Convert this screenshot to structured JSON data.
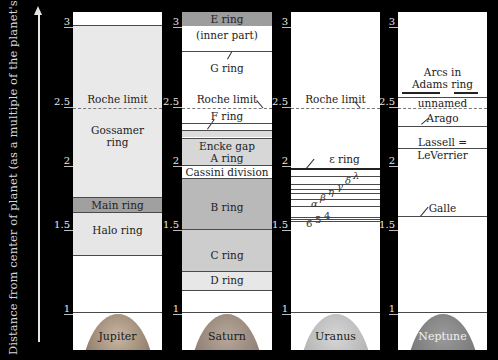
{
  "axis": {
    "label": "Distance from center of planet (as a multiple of the planet's radius)",
    "ticks": [
      "3",
      "2.5",
      "2",
      "1.5",
      "1"
    ]
  },
  "colors": {
    "background": "#000000",
    "column": "#ffffff",
    "light_band": "#e7e7e7",
    "medium_band": "#cfcfcf",
    "dark_band": "#9d9d9d",
    "roche_dash": "#777777"
  },
  "planets": [
    {
      "name": "Jupiter",
      "roche_label": "Roche limit",
      "rings": [
        {
          "label": "Gossamer ring",
          "line1": "Gossamer",
          "line2": "ring"
        },
        {
          "label": "Main ring"
        },
        {
          "label": "Halo ring"
        }
      ]
    },
    {
      "name": "Saturn",
      "roche_label": "Roche limit",
      "rings": [
        {
          "label": "E ring"
        },
        {
          "label": "(inner part)"
        },
        {
          "label": "G ring"
        },
        {
          "label": "F ring"
        },
        {
          "label": "Encke gap"
        },
        {
          "label": "A ring"
        },
        {
          "label": "Cassini division"
        },
        {
          "label": "B ring"
        },
        {
          "label": "C ring"
        },
        {
          "label": "D ring"
        }
      ]
    },
    {
      "name": "Uranus",
      "roche_label": "Roche limit",
      "rings": [
        {
          "label": "ε ring",
          "symbol": "ε"
        },
        {
          "label": "λ"
        },
        {
          "label": "δ"
        },
        {
          "label": "γ"
        },
        {
          "label": "η"
        },
        {
          "label": "β"
        },
        {
          "label": "α"
        },
        {
          "label": "4"
        },
        {
          "label": "5"
        },
        {
          "label": "6"
        }
      ]
    },
    {
      "name": "Neptune",
      "roche_label": "",
      "rings": [
        {
          "label": "Arcs in Adams ring",
          "line1": "Arcs in",
          "line2": "Adams ring"
        },
        {
          "label": "unnamed"
        },
        {
          "label": "Arago"
        },
        {
          "label": "Lassell = LeVerrier",
          "line1": "Lassell =",
          "line2": "LeVerrier"
        },
        {
          "label": "Galle"
        }
      ]
    }
  ]
}
